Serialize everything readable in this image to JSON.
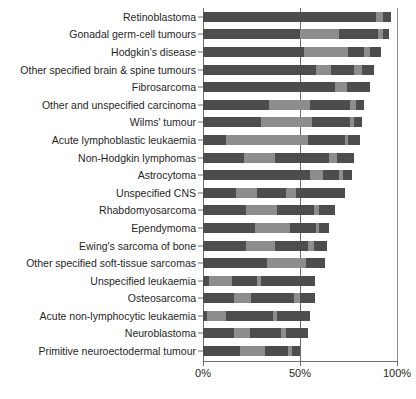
{
  "chart_data": {
    "type": "bar",
    "orientation": "horizontal",
    "stacked": true,
    "title": "",
    "subtitle": "",
    "xlabel": "",
    "ylabel": "",
    "xlim": [
      0,
      100
    ],
    "xticks": [
      0,
      50,
      100
    ],
    "xtick_labels": [
      "0%",
      "50%",
      "100%"
    ],
    "grid": false,
    "reference_line": 50,
    "legend_position": "none",
    "series": [
      {
        "name": "segment-1",
        "shade": "dark"
      },
      {
        "name": "segment-2",
        "shade": "light"
      },
      {
        "name": "segment-3",
        "shade": "dark"
      },
      {
        "name": "segment-4",
        "shade": "light"
      },
      {
        "name": "segment-5",
        "shade": "dark"
      }
    ],
    "categories": [
      "Retinoblastoma",
      "Gonadal germ-cell tumours",
      "Hodgkin's disease",
      "Other specified brain & spine tumours",
      "Fibrosarcoma",
      "Other and unspecified carcinoma",
      "Wilms' tumour",
      "Acute lymphoblastic leukaemia",
      "Non-Hodgkin lymphomas",
      "Astrocytoma",
      "Unspecified CNS",
      "Rhabdomyosarcoma",
      "Ependymoma",
      "Ewing's sarcoma of bone",
      "Other specified soft-tissue sarcomas",
      "Unspecified leukaemia",
      "Osteosarcoma",
      "Acute non-lymphocytic leukaemia",
      "Neuroblastoma",
      "Primitive neuroectodermal tumour"
    ],
    "totals": [
      97,
      96,
      92,
      88,
      86,
      83,
      82,
      81,
      78,
      77,
      73,
      68,
      65,
      64,
      63,
      58,
      58,
      55,
      54,
      50
    ],
    "bars": [
      {
        "category": "Retinoblastoma",
        "total": 97,
        "segments": [
          {
            "shade": "dark",
            "value": 89
          },
          {
            "shade": "light",
            "value": 4
          },
          {
            "shade": "dark",
            "value": 4
          }
        ]
      },
      {
        "category": "Gonadal germ-cell tumours",
        "total": 96,
        "segments": [
          {
            "shade": "dark",
            "value": 50
          },
          {
            "shade": "light",
            "value": 20
          },
          {
            "shade": "dark",
            "value": 20
          },
          {
            "shade": "light",
            "value": 3
          },
          {
            "shade": "dark",
            "value": 3
          }
        ]
      },
      {
        "category": "Hodgkin's disease",
        "total": 92,
        "segments": [
          {
            "shade": "dark",
            "value": 52
          },
          {
            "shade": "light",
            "value": 23
          },
          {
            "shade": "dark",
            "value": 8
          },
          {
            "shade": "light",
            "value": 3
          },
          {
            "shade": "dark",
            "value": 6
          }
        ]
      },
      {
        "category": "Other specified brain & spine tumours",
        "total": 88,
        "segments": [
          {
            "shade": "dark",
            "value": 58
          },
          {
            "shade": "light",
            "value": 8
          },
          {
            "shade": "dark",
            "value": 12
          },
          {
            "shade": "light",
            "value": 4
          },
          {
            "shade": "dark",
            "value": 6
          }
        ]
      },
      {
        "category": "Fibrosarcoma",
        "total": 86,
        "segments": [
          {
            "shade": "dark",
            "value": 68
          },
          {
            "shade": "light",
            "value": 6
          },
          {
            "shade": "dark",
            "value": 12
          }
        ]
      },
      {
        "category": "Other and unspecified carcinoma",
        "total": 83,
        "segments": [
          {
            "shade": "dark",
            "value": 34
          },
          {
            "shade": "light",
            "value": 21
          },
          {
            "shade": "dark",
            "value": 21
          },
          {
            "shade": "light",
            "value": 3
          },
          {
            "shade": "dark",
            "value": 4
          }
        ]
      },
      {
        "category": "Wilms' tumour",
        "total": 82,
        "segments": [
          {
            "shade": "dark",
            "value": 30
          },
          {
            "shade": "light",
            "value": 26
          },
          {
            "shade": "dark",
            "value": 20
          },
          {
            "shade": "light",
            "value": 2
          },
          {
            "shade": "dark",
            "value": 4
          }
        ]
      },
      {
        "category": "Acute lymphoblastic leukaemia",
        "total": 81,
        "segments": [
          {
            "shade": "dark",
            "value": 12
          },
          {
            "shade": "light",
            "value": 42
          },
          {
            "shade": "dark",
            "value": 19
          },
          {
            "shade": "light",
            "value": 2
          },
          {
            "shade": "dark",
            "value": 6
          }
        ]
      },
      {
        "category": "Non-Hodgkin lymphomas",
        "total": 78,
        "segments": [
          {
            "shade": "dark",
            "value": 21
          },
          {
            "shade": "light",
            "value": 16
          },
          {
            "shade": "dark",
            "value": 28
          },
          {
            "shade": "light",
            "value": 4
          },
          {
            "shade": "dark",
            "value": 9
          }
        ]
      },
      {
        "category": "Astrocytoma",
        "total": 77,
        "segments": [
          {
            "shade": "dark",
            "value": 55
          },
          {
            "shade": "light",
            "value": 7
          },
          {
            "shade": "dark",
            "value": 8
          },
          {
            "shade": "light",
            "value": 2
          },
          {
            "shade": "dark",
            "value": 5
          }
        ]
      },
      {
        "category": "Unspecified CNS",
        "total": 73,
        "segments": [
          {
            "shade": "dark",
            "value": 17
          },
          {
            "shade": "light",
            "value": 11
          },
          {
            "shade": "dark",
            "value": 15
          },
          {
            "shade": "light",
            "value": 5
          },
          {
            "shade": "dark",
            "value": 25
          }
        ]
      },
      {
        "category": "Rhabdomyosarcoma",
        "total": 68,
        "segments": [
          {
            "shade": "dark",
            "value": 22
          },
          {
            "shade": "light",
            "value": 16
          },
          {
            "shade": "dark",
            "value": 19
          },
          {
            "shade": "light",
            "value": 3
          },
          {
            "shade": "dark",
            "value": 8
          }
        ]
      },
      {
        "category": "Ependymoma",
        "total": 65,
        "segments": [
          {
            "shade": "dark",
            "value": 27
          },
          {
            "shade": "light",
            "value": 18
          },
          {
            "shade": "dark",
            "value": 13
          },
          {
            "shade": "light",
            "value": 2
          },
          {
            "shade": "dark",
            "value": 5
          }
        ]
      },
      {
        "category": "Ewing's sarcoma of bone",
        "total": 64,
        "segments": [
          {
            "shade": "dark",
            "value": 22
          },
          {
            "shade": "light",
            "value": 15
          },
          {
            "shade": "dark",
            "value": 17
          },
          {
            "shade": "light",
            "value": 3
          },
          {
            "shade": "dark",
            "value": 7
          }
        ]
      },
      {
        "category": "Other specified soft-tissue sarcomas",
        "total": 63,
        "segments": [
          {
            "shade": "dark",
            "value": 33
          },
          {
            "shade": "light",
            "value": 20
          },
          {
            "shade": "dark",
            "value": 10
          }
        ]
      },
      {
        "category": "Unspecified leukaemia",
        "total": 58,
        "segments": [
          {
            "shade": "dark",
            "value": 3
          },
          {
            "shade": "light",
            "value": 12
          },
          {
            "shade": "dark",
            "value": 13
          },
          {
            "shade": "light",
            "value": 2
          },
          {
            "shade": "dark",
            "value": 28
          }
        ]
      },
      {
        "category": "Osteosarcoma",
        "total": 58,
        "segments": [
          {
            "shade": "dark",
            "value": 16
          },
          {
            "shade": "light",
            "value": 9
          },
          {
            "shade": "dark",
            "value": 22
          },
          {
            "shade": "light",
            "value": 3
          },
          {
            "shade": "dark",
            "value": 8
          }
        ]
      },
      {
        "category": "Acute non-lymphocytic leukaemia",
        "total": 55,
        "segments": [
          {
            "shade": "dark",
            "value": 2
          },
          {
            "shade": "light",
            "value": 10
          },
          {
            "shade": "dark",
            "value": 24
          },
          {
            "shade": "light",
            "value": 2
          },
          {
            "shade": "dark",
            "value": 17
          }
        ]
      },
      {
        "category": "Neuroblastoma",
        "total": 54,
        "segments": [
          {
            "shade": "dark",
            "value": 16
          },
          {
            "shade": "light",
            "value": 8
          },
          {
            "shade": "dark",
            "value": 16
          },
          {
            "shade": "light",
            "value": 3
          },
          {
            "shade": "dark",
            "value": 11
          }
        ]
      },
      {
        "category": "Primitive neuroectodermal tumour",
        "total": 50,
        "segments": [
          {
            "shade": "dark",
            "value": 19
          },
          {
            "shade": "light",
            "value": 13
          },
          {
            "shade": "dark",
            "value": 12
          },
          {
            "shade": "light",
            "value": 2
          },
          {
            "shade": "dark",
            "value": 4
          }
        ]
      }
    ],
    "colors": {
      "dark": "#4d4d4d",
      "light": "#8d8d8d",
      "axis": "#6e6e6e",
      "background": "#ffffff",
      "text": "#1f1f1f"
    }
  }
}
